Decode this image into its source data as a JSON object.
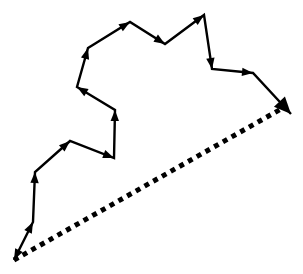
{
  "figure": {
    "title": "Vector displacement path diagram",
    "background_color": "#ffffff",
    "stroke_color": "#000000",
    "canvas": {
      "width": 303,
      "height": 274
    }
  },
  "chart_data": {
    "type": "line",
    "title": "Vector displacement path diagram",
    "xlabel": "",
    "ylabel": "",
    "grid": false,
    "legend": "none",
    "xlim": [
      0,
      303
    ],
    "ylim": [
      0,
      274
    ],
    "series": [
      {
        "name": "solid-path",
        "style": "solid",
        "color": "#000000",
        "stroke_width": 2.4,
        "arrowheads": "every-vertex",
        "points": [
          [
            14,
            260
          ],
          [
            33,
            222
          ],
          [
            35,
            172
          ],
          [
            70,
            141
          ],
          [
            114,
            158
          ],
          [
            115,
            110
          ],
          [
            77,
            87
          ],
          [
            88,
            48
          ],
          [
            130,
            22
          ],
          [
            165,
            44
          ],
          [
            204,
            15
          ],
          [
            212,
            69
          ],
          [
            253,
            73
          ],
          [
            291,
            114
          ]
        ]
      },
      {
        "name": "dotted-resultant",
        "style": "dotted",
        "color": "#000000",
        "stroke_width": 5,
        "dash_pattern": "5 5",
        "arrowheads": "end",
        "points": [
          [
            14,
            260
          ],
          [
            291,
            114
          ]
        ]
      }
    ]
  },
  "segments": [
    {
      "index": 1,
      "from": [
        14,
        260
      ],
      "to": [
        33,
        222
      ],
      "direction": "up-right",
      "arrow_at": "to"
    },
    {
      "index": 2,
      "from": [
        33,
        222
      ],
      "to": [
        35,
        172
      ],
      "direction": "up",
      "arrow_at": "to"
    },
    {
      "index": 3,
      "from": [
        35,
        172
      ],
      "to": [
        70,
        141
      ],
      "direction": "up-right",
      "arrow_at": "to"
    },
    {
      "index": 4,
      "from": [
        70,
        141
      ],
      "to": [
        114,
        158
      ],
      "direction": "down-right",
      "arrow_at": "to"
    },
    {
      "index": 5,
      "from": [
        114,
        158
      ],
      "to": [
        115,
        110
      ],
      "direction": "up",
      "arrow_at": "to"
    },
    {
      "index": 6,
      "from": [
        115,
        110
      ],
      "to": [
        77,
        87
      ],
      "direction": "up-left",
      "arrow_at": "to"
    },
    {
      "index": 7,
      "from": [
        77,
        87
      ],
      "to": [
        88,
        48
      ],
      "direction": "up-right",
      "arrow_at": "to"
    },
    {
      "index": 8,
      "from": [
        88,
        48
      ],
      "to": [
        130,
        22
      ],
      "direction": "up-right",
      "arrow_at": "to"
    },
    {
      "index": 9,
      "from": [
        130,
        22
      ],
      "to": [
        165,
        44
      ],
      "direction": "down-right",
      "arrow_at": "to"
    },
    {
      "index": 10,
      "from": [
        165,
        44
      ],
      "to": [
        204,
        15
      ],
      "direction": "up-right",
      "arrow_at": "to"
    },
    {
      "index": 11,
      "from": [
        204,
        15
      ],
      "to": [
        212,
        69
      ],
      "direction": "down",
      "arrow_at": "to"
    },
    {
      "index": 12,
      "from": [
        212,
        69
      ],
      "to": [
        253,
        73
      ],
      "direction": "right",
      "arrow_at": "to"
    },
    {
      "index": 13,
      "from": [
        253,
        73
      ],
      "to": [
        291,
        114
      ],
      "direction": "down-right",
      "arrow_at": "to"
    },
    {
      "index": 14,
      "from": [
        14,
        260
      ],
      "to": [
        291,
        114
      ],
      "direction": "up-right",
      "arrow_at": "to",
      "style": "dotted"
    }
  ],
  "origin_marker": {
    "name": "origin-arrowhead",
    "position": [
      14,
      260
    ],
    "direction": "down-left"
  },
  "end_marker": {
    "name": "terminal-arrowhead",
    "position": [
      291,
      114
    ],
    "direction": "down-right"
  }
}
